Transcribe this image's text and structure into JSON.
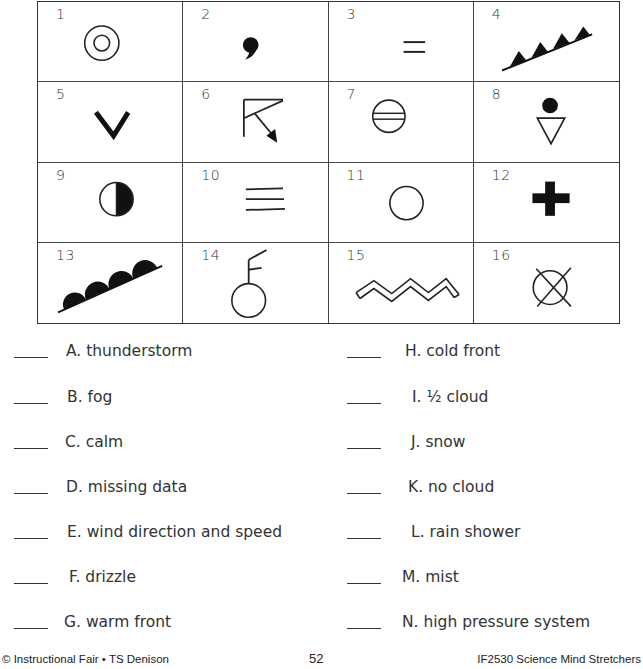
{
  "symbols": [
    {
      "number": "1",
      "icon": "double-circle-icon"
    },
    {
      "number": "2",
      "icon": "comma-drizzle-icon"
    },
    {
      "number": "3",
      "icon": "two-lines-mist-icon"
    },
    {
      "number": "4",
      "icon": "cold-front-triangles-icon"
    },
    {
      "number": "5",
      "icon": "v-shape-icon"
    },
    {
      "number": "6",
      "icon": "wind-barb-arrow-icon"
    },
    {
      "number": "7",
      "icon": "circle-double-line-icon"
    },
    {
      "number": "8",
      "icon": "dot-over-triangle-icon"
    },
    {
      "number": "9",
      "icon": "half-filled-circle-icon"
    },
    {
      "number": "10",
      "icon": "three-lines-fog-icon"
    },
    {
      "number": "11",
      "icon": "empty-circle-icon"
    },
    {
      "number": "12",
      "icon": "thick-plus-icon"
    },
    {
      "number": "13",
      "icon": "warm-front-semicircles-icon"
    },
    {
      "number": "14",
      "icon": "circle-with-wind-barb-icon"
    },
    {
      "number": "15",
      "icon": "double-zigzag-icon"
    },
    {
      "number": "16",
      "icon": "circle-x-missing-icon"
    }
  ],
  "left_items": [
    {
      "letter": "A.",
      "text": "thunderstorm"
    },
    {
      "letter": "B.",
      "text": "fog"
    },
    {
      "letter": "C.",
      "text": "calm"
    },
    {
      "letter": "D.",
      "text": "missing data"
    },
    {
      "letter": "E.",
      "text": "wind direction and speed"
    },
    {
      "letter": "F.",
      "text": "drizzle"
    },
    {
      "letter": "G.",
      "text": "warm front"
    }
  ],
  "right_items": [
    {
      "letter": "H.",
      "text": "cold front"
    },
    {
      "letter": "I.",
      "text": "½ cloud"
    },
    {
      "letter": "J.",
      "text": "snow"
    },
    {
      "letter": "K.",
      "text": "no cloud"
    },
    {
      "letter": "L.",
      "text": "rain shower"
    },
    {
      "letter": "M.",
      "text": "mist"
    },
    {
      "letter": "N.",
      "text": "high pressure system"
    }
  ],
  "footer": {
    "left": "© Instructional Fair • TS Denison",
    "page": "52",
    "right": "IF2530 Science Mind Stretchers"
  }
}
